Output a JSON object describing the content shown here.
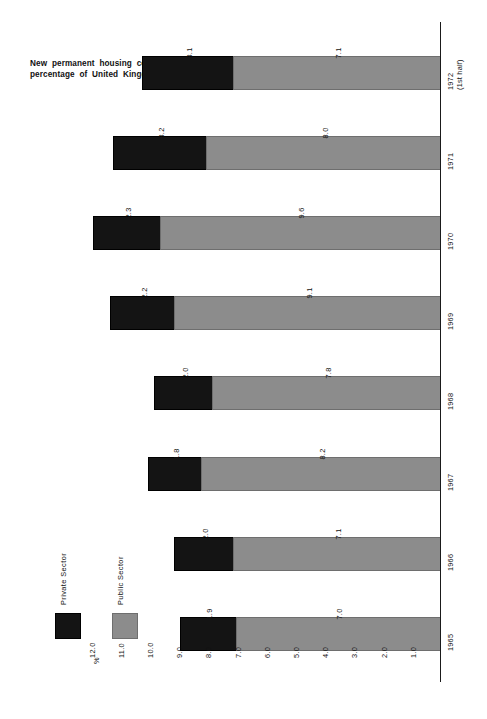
{
  "chart_data": {
    "type": "bar",
    "orientation": "horizontal-rotated",
    "stacked": true,
    "title": "New permanent housing completions in Scotland as a percentage of United Kingdom completions 1965/71",
    "title_lines": [
      "New  permanent  housing  completions  in  Scotland  as   a",
      "percentage  of  United  Kingdom  completions  1965/71"
    ],
    "xlabel": "",
    "ylabel": "%",
    "axis_unit": "%",
    "ylim": [
      0,
      12.0
    ],
    "grid": false,
    "legend_position": "left",
    "categories": [
      "1965",
      "1966",
      "1967",
      "1968",
      "1969",
      "1970",
      "1971",
      "1972 (1st half)"
    ],
    "category_labels": [
      {
        "line1": "1965",
        "line2": ""
      },
      {
        "line1": "1966",
        "line2": ""
      },
      {
        "line1": "1967",
        "line2": ""
      },
      {
        "line1": "1968",
        "line2": ""
      },
      {
        "line1": "1969",
        "line2": ""
      },
      {
        "line1": "1970",
        "line2": ""
      },
      {
        "line1": "1971",
        "line2": ""
      },
      {
        "line1": "1972",
        "line2": "(1st half)"
      }
    ],
    "tick_labels": [
      "12.0",
      "11.0",
      "10.0",
      "9.0",
      "8.0",
      "7.0",
      "6.0",
      "5.0",
      "4.0",
      "3.0",
      "2.0",
      "1.0"
    ],
    "tick_values": [
      12.0,
      11.0,
      10.0,
      9.0,
      8.0,
      7.0,
      6.0,
      5.0,
      4.0,
      3.0,
      2.0,
      1.0
    ],
    "series": [
      {
        "name": "Public Sector",
        "color": "#8c8c8c",
        "values": [
          7.0,
          7.1,
          8.2,
          7.8,
          9.1,
          9.6,
          8.0,
          7.1
        ]
      },
      {
        "name": "Private Sector",
        "color": "#141414",
        "values": [
          1.9,
          2.0,
          1.8,
          2.0,
          2.2,
          2.3,
          3.2,
          3.1
        ]
      }
    ],
    "value_labels": {
      "1965": {
        "private": "1.9",
        "public": "7.0"
      },
      "1966": {
        "private": "2.0",
        "public": "7.1"
      },
      "1967": {
        "private": "1.8",
        "public": "8.2"
      },
      "1968": {
        "private": "2.0",
        "public": "7.8"
      },
      "1969": {
        "private": "2.2",
        "public": "9.1"
      },
      "1970": {
        "private": "2.3",
        "public": "9.6"
      },
      "1971": {
        "private": "3.2",
        "public": "8.0"
      },
      "1972 (1st half)": {
        "private": "3.1",
        "public": "7.1"
      }
    },
    "totals": [
      8.9,
      9.1,
      10.0,
      9.8,
      11.3,
      11.9,
      11.2,
      10.2
    ]
  },
  "legend": {
    "items": [
      {
        "label": "Private Sector",
        "swatch": "black",
        "color": "#141414"
      },
      {
        "label": "Public Sector",
        "swatch": "grey",
        "color": "#8c8c8c"
      }
    ]
  },
  "colors": {
    "private": "#141414",
    "public": "#8c8c8c",
    "axis": "#1a1a1a",
    "background": "#ffffff",
    "text": "#111111"
  }
}
